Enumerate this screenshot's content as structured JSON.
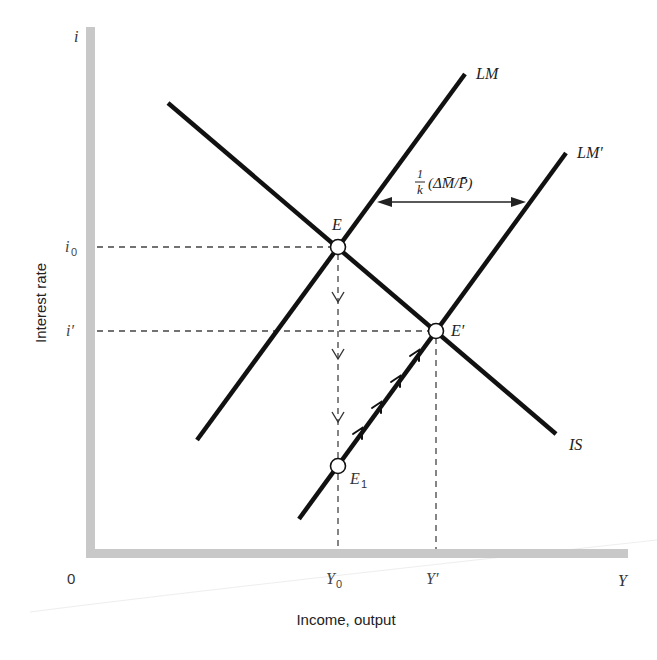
{
  "diagram": {
    "type": "IS-LM",
    "axes": {
      "y_symbol": "i",
      "y_label": "Interest rate",
      "x_symbol": "Y",
      "x_label": "Income, output",
      "origin": "0"
    },
    "tick_labels": {
      "i0": "i",
      "i0_sub": "0",
      "i_prime": "i′",
      "Y0": "Y",
      "Y0_sub": "0",
      "Y_prime": "Y′"
    },
    "curves": {
      "IS": "IS",
      "LM": "LM",
      "LM_prime": "LM′"
    },
    "points": {
      "E": "E",
      "E_prime": "E′",
      "E1": "E",
      "E1_sub": "1"
    },
    "shift_annotation": {
      "numerator": "1",
      "denominator": "k",
      "expression": "(ΔM̄/P̄)"
    },
    "colors": {
      "axis": "#c8c8c8",
      "curve": "#111111",
      "dashed": "#444444",
      "text": "#222222"
    }
  }
}
